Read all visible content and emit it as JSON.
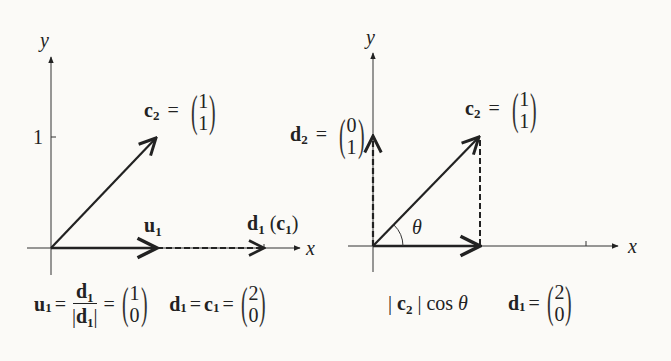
{
  "left_diagram": {
    "axes": {
      "x_label": "x",
      "y_label": "y",
      "y_tick_label": "1"
    },
    "vectors": {
      "c2": {
        "name": "c",
        "sub": "2",
        "components": [
          "1",
          "1"
        ]
      },
      "u1": {
        "name": "u",
        "sub": "1"
      },
      "d1": {
        "name": "d",
        "sub": "1",
        "paren_name": "c",
        "paren_sub": "1"
      }
    },
    "caption": {
      "u1_name": "u",
      "u1_sub": "1",
      "frac_num_name": "d",
      "frac_num_sub": "1",
      "frac_den_name": "d",
      "frac_den_sub": "1",
      "u1_components": [
        "1",
        "0"
      ],
      "d1_name": "d",
      "d1_sub": "1",
      "c1_name": "c",
      "c1_sub": "1",
      "d1_components": [
        "2",
        "0"
      ],
      "equals": "="
    }
  },
  "right_diagram": {
    "axes": {
      "x_label": "x",
      "y_label": "y"
    },
    "angle_label": "θ",
    "vectors": {
      "c2": {
        "name": "c",
        "sub": "2",
        "components": [
          "1",
          "1"
        ]
      },
      "d2": {
        "name": "d",
        "sub": "2",
        "components": [
          "0",
          "1"
        ]
      }
    },
    "caption": {
      "proj_name": "c",
      "proj_sub": "2",
      "proj_func": "cos",
      "proj_angle": "θ",
      "d1_name": "d",
      "d1_sub": "1",
      "d1_components": [
        "2",
        "0"
      ],
      "equals": "="
    }
  },
  "colors": {
    "ink": "#222222",
    "background": "#fbfaf7"
  }
}
